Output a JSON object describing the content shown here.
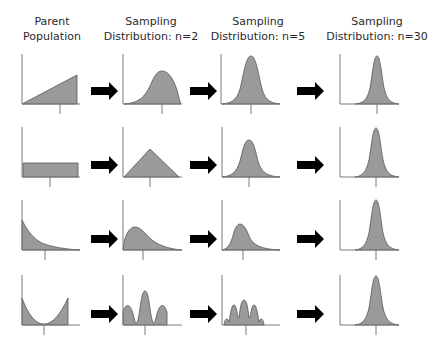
{
  "columns": [
    {
      "line1": "Parent",
      "line2": "Population",
      "cx": 52
    },
    {
      "line1": "Sampling",
      "line2": "Distribution: n=2",
      "cx": 151
    },
    {
      "line1": "Sampling",
      "line2": "Distribution: n=5",
      "cx": 258
    },
    {
      "line1": "Sampling",
      "line2": "Distribution: n=30",
      "cx": 377
    }
  ],
  "colors": {
    "fill": "#9a9a9a",
    "stroke": "#555555",
    "axis": "#7a7a7a",
    "arrow": "#000000",
    "text": "#2a2a2a"
  },
  "rows": [
    {
      "name": "right-triangular",
      "baseline": 104,
      "panels": [
        {
          "axisX": 22,
          "right": 80,
          "tick": 60,
          "shape": "M22,104 L77,75 L77,104 Z"
        },
        {
          "axisX": 123,
          "right": 182,
          "tick": 162,
          "shape": "M124,104 C140,103 145,96 150,86 C155,74 158,71 162,71 C168,71 173,78 177,90 C179,98 180,102 181,104 Z"
        },
        {
          "axisX": 221,
          "right": 280,
          "tick": 251,
          "shape": "M222,104 C234,103 238,98 241,85 C245,66 247,56 251,56 C255,56 257,66 261,85 C264,98 268,103 280,104 Z"
        },
        {
          "axisX": 340,
          "right": 399,
          "tick": 377,
          "shape": "M355,104 C364,103 367,100 370,88 C373,70 374,56 377,56 C380,56 381,70 384,88 C387,100 390,103 399,104 Z"
        }
      ]
    },
    {
      "name": "uniform",
      "baseline": 177,
      "panels": [
        {
          "axisX": 22,
          "right": 80,
          "tick": 50,
          "shape": "M23,177 L23,163 L78,163 L78,177 Z"
        },
        {
          "axisX": 123,
          "right": 182,
          "tick": 150,
          "shape": "M124,177 L150,149 L179,177 Z"
        },
        {
          "axisX": 222,
          "right": 280,
          "tick": 249,
          "shape": "M222,177 C234,176 238,170 241,157 C244,144 246,140 249,140 C252,140 254,144 257,157 C260,170 264,176 280,177 Z"
        },
        {
          "axisX": 340,
          "right": 399,
          "tick": 376,
          "shape": "M355,177 C363,176 366,172 369,160 C372,142 373,128 376,128 C379,128 380,142 383,160 C386,172 389,176 399,177 Z"
        }
      ]
    },
    {
      "name": "exponential",
      "baseline": 250,
      "panels": [
        {
          "axisX": 22,
          "right": 80,
          "tick": 45,
          "shape": "M22,250 L22,220 C28,232 34,239 42,243 C52,247 64,249 80,250 Z"
        },
        {
          "axisX": 123,
          "right": 182,
          "tick": 143,
          "shape": "M123,250 C124,236 129,227 135,227 C141,227 145,234 152,240 C160,246 170,249 182,250 Z"
        },
        {
          "axisX": 222,
          "right": 280,
          "tick": 243,
          "shape": "M222,250 C229,249 232,240 234,232 C236,226 238,224 240,224 C243,224 246,228 249,236 C253,245 260,249 280,250 Z"
        },
        {
          "axisX": 340,
          "right": 399,
          "tick": 376,
          "shape": "M355,250 C363,249 366,245 369,233 C372,214 373,200 376,200 C379,200 380,214 383,233 C386,245 389,249 399,250 Z"
        }
      ]
    },
    {
      "name": "u-shaped",
      "baseline": 325,
      "panels": [
        {
          "axisX": 22,
          "right": 80,
          "tick": 44,
          "shape": "M22,325 L22,298 C28,314 35,324 44,324 C53,324 61,313 68,298 L68,325 Z"
        },
        {
          "axisX": 123,
          "right": 182,
          "tick": 145,
          "shape": "M123,325 L123,312 C126,302 131,303 134,318 C136,325 137,325 139,315 C141,302 142,291 145,291 C148,291 149,302 151,315 C153,325 154,325 156,318 C159,303 164,302 167,312 L167,325 Z"
        },
        {
          "axisX": 222,
          "right": 280,
          "tick": 246,
          "shape": "M224,325 C225,317 228,318 229,322 C230,318 231,305 234,305 C237,305 237,318 239,318 C240,310 241,300 244,300 C247,300 248,310 249,318 C251,318 251,305 254,305 C257,305 258,318 259,322 C260,318 263,317 264,325 Z"
        },
        {
          "axisX": 340,
          "right": 399,
          "tick": 376,
          "shape": "M355,325 C363,324 366,320 369,308 C372,290 373,276 376,276 C379,276 380,290 383,308 C386,320 389,324 399,325 Z"
        }
      ]
    }
  ],
  "arrows": [
    {
      "x": 91,
      "y": 91
    },
    {
      "x": 190,
      "y": 91
    },
    {
      "x": 297,
      "y": 91
    },
    {
      "x": 91,
      "y": 165
    },
    {
      "x": 190,
      "y": 165
    },
    {
      "x": 297,
      "y": 165
    },
    {
      "x": 91,
      "y": 239
    },
    {
      "x": 190,
      "y": 239
    },
    {
      "x": 297,
      "y": 239
    },
    {
      "x": 91,
      "y": 314
    },
    {
      "x": 190,
      "y": 314
    },
    {
      "x": 297,
      "y": 314
    }
  ]
}
